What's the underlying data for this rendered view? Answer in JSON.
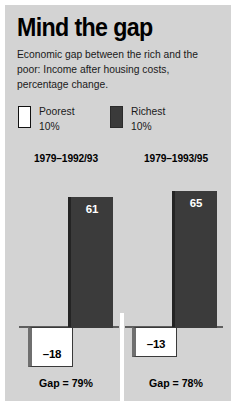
{
  "title": "Mind the gap",
  "subtitle": "Economic gap between the rich and the poor: Income after housing costs, percentage change.",
  "legend": {
    "poorest": {
      "line1": "Poorest",
      "line2": "10%",
      "swatch": "white-swatch-icon",
      "color": "#ffffff"
    },
    "richest": {
      "line1": "Richest",
      "line2": "10%",
      "swatch": "dark-swatch-icon",
      "color": "#3a3a3a"
    }
  },
  "colors": {
    "panel_background": "#d3d3d3",
    "bar_dark": "#3b3b3b",
    "bar_light": "#ffffff",
    "baseline": "#5e5e5e",
    "divider": "#ffffff",
    "text": "#000000"
  },
  "panels": [
    {
      "header": "1979–1992/93",
      "richest_label": "61",
      "poorest_label": "–18",
      "footer": "Gap = 79%"
    },
    {
      "header": "1979–1993/95",
      "richest_label": "65",
      "poorest_label": "–13",
      "footer": "Gap = 78%"
    }
  ],
  "chart_data": {
    "type": "bar",
    "title": "Mind the gap",
    "subtitle": "Economic gap between the rich and the poor: Income after housing costs, percentage change.",
    "categories": [
      "1979–1992/93",
      "1979–1993/95"
    ],
    "series": [
      {
        "name": "Poorest 10%",
        "values": [
          -18,
          -13
        ],
        "color": "#ffffff"
      },
      {
        "name": "Richest 10%",
        "values": [
          61,
          65
        ],
        "color": "#3b3b3b"
      }
    ],
    "annotations": [
      "Gap = 79%",
      "Gap = 78%"
    ],
    "xlabel": "",
    "ylabel": "Income after housing costs, percentage change",
    "ylim": [
      -20,
      70
    ],
    "grid": false,
    "legend_position": "top-left",
    "baseline": 0
  }
}
